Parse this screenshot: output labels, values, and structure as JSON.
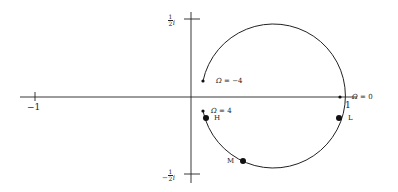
{
  "diagram": {
    "type": "nyquist-plot",
    "axes": {
      "real_ticks": [
        {
          "value": -1,
          "label": "−1"
        },
        {
          "value": 1,
          "label": "1"
        }
      ],
      "imag_ticks": [
        {
          "value": 0.5,
          "label_num": "1",
          "label_den": "2",
          "label_suffix": "i",
          "sign": ""
        },
        {
          "value": -0.5,
          "label_num": "1",
          "label_den": "2",
          "label_suffix": "i",
          "sign": "−"
        }
      ]
    },
    "curve": {
      "shape": "circle-arc",
      "center": [
        0.5,
        0
      ],
      "radius": 0.5,
      "color": "#222222"
    },
    "annotations": [
      {
        "id": "omega-neg4",
        "symbol": "Ω",
        "text": " = −4"
      },
      {
        "id": "omega-0",
        "symbol": "Ω",
        "text": " = 0"
      },
      {
        "id": "omega-4",
        "symbol": "Ω",
        "text": " = 4"
      }
    ],
    "points": [
      {
        "id": "H",
        "label": "H"
      },
      {
        "id": "L",
        "label": "L"
      },
      {
        "id": "M",
        "label": "M"
      }
    ]
  }
}
